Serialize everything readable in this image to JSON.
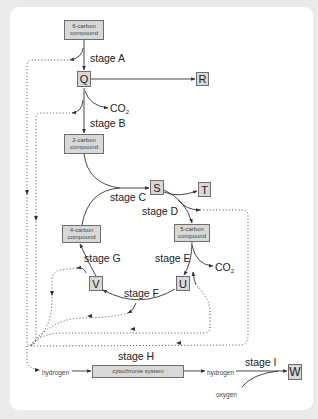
{
  "diagram": {
    "compounds": {
      "six_carbon": "6-carbon compound",
      "two_carbon": "2-carbon compound",
      "four_carbon": "4-carbon compound",
      "five_carbon": "5-carbon compound",
      "cytochrome": "cytochrome system"
    },
    "letters": {
      "Q": "Q",
      "R": "R",
      "S": "S",
      "T": "T",
      "U": "U",
      "V": "V",
      "W": "W"
    },
    "stages": {
      "A": "stage A",
      "B": "stage B",
      "C": "stage C",
      "D": "stage D",
      "E": "stage E",
      "F": "stage F",
      "G": "stage G",
      "H": "stage H",
      "I": "stage I"
    },
    "molecules": {
      "co2_base": "CO",
      "co2_sub": "2",
      "hydrogen_in": "hydrogen",
      "hydrogen_out": "hydrogen",
      "oxygen": "oxygen"
    },
    "colors": {
      "box_fill": "#d8d8d8",
      "box_border": "#6e6e6e",
      "line": "#333333",
      "background": "#ebebeb",
      "card": "#ffffff"
    }
  }
}
